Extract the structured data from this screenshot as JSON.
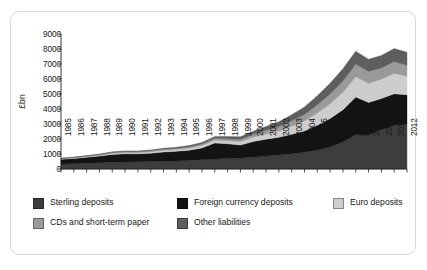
{
  "figure": {
    "y_axis_title": "£bn"
  },
  "chart_data": {
    "type": "area",
    "title": "",
    "subtitle": "",
    "xlabel": "",
    "ylabel": "£bn",
    "stacked": true,
    "grid": false,
    "legend_position": "bottom",
    "ylim": [
      0,
      9000
    ],
    "ytick_step": 1000,
    "yticks": [
      "0",
      "1000",
      "2000",
      "3000",
      "4000",
      "5000",
      "6000",
      "7000",
      "8000",
      "9000"
    ],
    "categories": [
      "1985",
      "1986",
      "1987",
      "1988",
      "1989",
      "1990",
      "1991",
      "1992",
      "1993",
      "1994",
      "1995",
      "1996",
      "1997",
      "1998",
      "1999",
      "2000",
      "2001",
      "2002",
      "2003",
      "2004",
      "2005",
      "2006",
      "2007",
      "2008",
      "2009",
      "2010",
      "2011",
      "2012"
    ],
    "series": [
      {
        "name": "Sterling deposits",
        "color": "#3d3d3d",
        "values": [
          330,
          355,
          385,
          420,
          455,
          470,
          480,
          495,
          515,
          540,
          575,
          615,
          660,
          700,
          735,
          790,
          860,
          930,
          1020,
          1120,
          1270,
          1470,
          1800,
          2280,
          2260,
          2620,
          2900,
          3000
        ]
      },
      {
        "name": "Foreign currency deposits",
        "color": "#131313",
        "values": [
          320,
          345,
          395,
          440,
          520,
          545,
          530,
          560,
          620,
          640,
          680,
          790,
          1080,
          980,
          860,
          1040,
          1130,
          1180,
          1290,
          1420,
          1650,
          1900,
          2150,
          2520,
          2180,
          2080,
          2110,
          1950
        ]
      },
      {
        "name": "Euro deposits",
        "color": "#cdcdcd",
        "values": [
          30,
          35,
          45,
          55,
          70,
          80,
          85,
          95,
          110,
          120,
          135,
          160,
          185,
          200,
          230,
          290,
          350,
          430,
          540,
          660,
          820,
          980,
          1160,
          1350,
          1280,
          1280,
          1360,
          1240
        ]
      },
      {
        "name": "CDs and short-term paper",
        "color": "#9a9a9a",
        "values": [
          25,
          30,
          35,
          40,
          50,
          55,
          55,
          60,
          65,
          75,
          85,
          100,
          120,
          135,
          150,
          190,
          240,
          290,
          360,
          440,
          540,
          650,
          760,
          850,
          780,
          760,
          790,
          720
        ]
      },
      {
        "name": "Other liabilities",
        "color": "#5e5e5e",
        "values": [
          25,
          30,
          35,
          40,
          50,
          55,
          55,
          60,
          70,
          80,
          90,
          110,
          130,
          150,
          170,
          210,
          260,
          320,
          400,
          490,
          600,
          710,
          820,
          850,
          810,
          830,
          870,
          880
        ]
      }
    ],
    "totals": [
      730,
      795,
      895,
      995,
      1145,
      1205,
      1205,
      1270,
      1380,
      1455,
      1565,
      1775,
      2175,
      2165,
      2145,
      2520,
      2840,
      3150,
      3610,
      4130,
      4880,
      5710,
      6690,
      7850,
      7310,
      7570,
      8030,
      7790
    ]
  }
}
